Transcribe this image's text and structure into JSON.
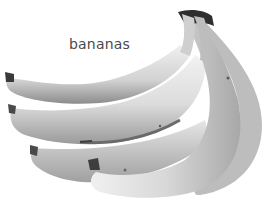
{
  "image": {
    "subject": "bunch of bananas",
    "style": "grayscale photograph",
    "label": "bananas",
    "colors": {
      "background": "#ffffff",
      "label_text": "#4a4a4a",
      "banana_light": "#e4e4e4",
      "banana_mid": "#b8b8b8",
      "banana_dark": "#5a5a5a",
      "stem": "#2e2e2e"
    }
  }
}
